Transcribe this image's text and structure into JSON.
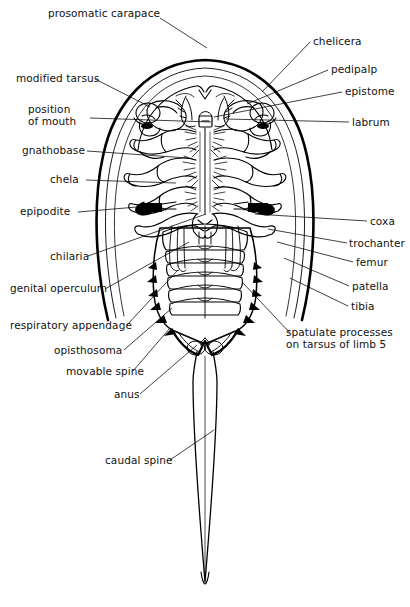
{
  "figure": {
    "organism": "horseshoe crab",
    "view": "ventral",
    "line_color": "#000000",
    "background_color": "#ffffff"
  },
  "labels": [
    {
      "id": "prosomatic-carapace",
      "text": "prosomatic carapace",
      "x": 48,
      "y": 8,
      "align": "left",
      "leader": [
        [
          160,
          18
        ],
        [
          207,
          48
        ]
      ]
    },
    {
      "id": "chelicera",
      "text": "chelicera",
      "x": 313,
      "y": 36,
      "align": "left",
      "leader": [
        [
          310,
          42
        ],
        [
          262,
          92
        ]
      ]
    },
    {
      "id": "pedipalp",
      "text": "pedipalp",
      "x": 331,
      "y": 64,
      "align": "left",
      "leader": [
        [
          328,
          70
        ],
        [
          247,
          104
        ]
      ]
    },
    {
      "id": "modified-tarsus",
      "text": "modified tarsus",
      "x": 16,
      "y": 73,
      "align": "left",
      "leader": [
        [
          95,
          79
        ],
        [
          150,
          107
        ]
      ]
    },
    {
      "id": "epistome",
      "text": "epistome",
      "x": 345,
      "y": 86,
      "align": "left",
      "leader": [
        [
          342,
          92
        ],
        [
          214,
          117
        ]
      ]
    },
    {
      "id": "position-of-mouth",
      "text": "position\nof mouth",
      "x": 28,
      "y": 104,
      "align": "left",
      "leader": [
        [
          90,
          118
        ],
        [
          211,
          122
        ]
      ]
    },
    {
      "id": "labrum",
      "text": "labrum",
      "x": 352,
      "y": 117,
      "align": "left",
      "leader": [
        [
          349,
          122
        ],
        [
          226,
          119
        ]
      ]
    },
    {
      "id": "gnathobase",
      "text": "gnathobase",
      "x": 22,
      "y": 145,
      "align": "left",
      "leader": [
        [
          87,
          151
        ],
        [
          188,
          158
        ]
      ]
    },
    {
      "id": "chela",
      "text": "chela",
      "x": 50,
      "y": 174,
      "align": "left",
      "leader": [
        [
          86,
          180
        ],
        [
          176,
          183
        ]
      ]
    },
    {
      "id": "epipodite",
      "text": "epipodite",
      "x": 20,
      "y": 206,
      "align": "left",
      "leader": [
        [
          78,
          212
        ],
        [
          149,
          206
        ]
      ]
    },
    {
      "id": "coxa",
      "text": "coxa",
      "x": 370,
      "y": 216,
      "align": "left",
      "leader": [
        [
          367,
          221
        ],
        [
          255,
          214
        ]
      ]
    },
    {
      "id": "trochanter",
      "text": "trochanter",
      "x": 349,
      "y": 238,
      "align": "left",
      "leader": [
        [
          347,
          243
        ],
        [
          268,
          229
        ]
      ]
    },
    {
      "id": "chilaria",
      "text": "chilaria",
      "x": 50,
      "y": 251,
      "align": "left",
      "leader": [
        [
          88,
          256
        ],
        [
          206,
          214
        ]
      ]
    },
    {
      "id": "femur",
      "text": "femur",
      "x": 356,
      "y": 257,
      "align": "left",
      "leader": [
        [
          353,
          262
        ],
        [
          277,
          242
        ]
      ]
    },
    {
      "id": "patella",
      "text": "patella",
      "x": 352,
      "y": 281,
      "align": "left",
      "leader": [
        [
          349,
          286
        ],
        [
          284,
          258
        ]
      ]
    },
    {
      "id": "genital-operculum",
      "text": "genital operculum",
      "x": 10,
      "y": 283,
      "align": "left",
      "leader": [
        [
          105,
          289
        ],
        [
          189,
          242
        ]
      ]
    },
    {
      "id": "tibia",
      "text": "tibia",
      "x": 351,
      "y": 301,
      "align": "left",
      "leader": [
        [
          348,
          306
        ],
        [
          290,
          278
        ]
      ]
    },
    {
      "id": "respiratory-appendage",
      "text": "respiratory appendage",
      "x": 10,
      "y": 320,
      "align": "left",
      "leader": [
        [
          127,
          325
        ],
        [
          178,
          270
        ]
      ]
    },
    {
      "id": "spatulate-processes",
      "text": "spatulate processes\non tarsus of limb 5",
      "x": 286,
      "y": 327,
      "align": "left",
      "leader": [
        [
          290,
          333
        ],
        [
          243,
          283
        ]
      ]
    },
    {
      "id": "opisthosoma",
      "text": "opisthosoma",
      "x": 54,
      "y": 345,
      "align": "left",
      "leader": [
        [
          124,
          350
        ],
        [
          172,
          308
        ]
      ]
    },
    {
      "id": "movable-spine",
      "text": "movable spine",
      "x": 66,
      "y": 366,
      "align": "left",
      "leader": [
        [
          133,
          371
        ],
        [
          170,
          328
        ]
      ]
    },
    {
      "id": "anus",
      "text": "anus",
      "x": 114,
      "y": 389,
      "align": "left",
      "leader": [
        [
          140,
          394
        ],
        [
          197,
          345
        ]
      ]
    },
    {
      "id": "caudal-spine",
      "text": "caudal spine",
      "x": 105,
      "y": 455,
      "align": "left",
      "leader": [
        [
          170,
          460
        ],
        [
          214,
          430
        ]
      ]
    }
  ],
  "anatomy": {
    "carapace": "horseshoe-shaped prosomal shield",
    "opisthosoma_plates": 6,
    "book_gill_pairs": 5,
    "marginal_spines": "movable spines along opisthosoma margin",
    "telson": "long tapering caudal spine"
  }
}
